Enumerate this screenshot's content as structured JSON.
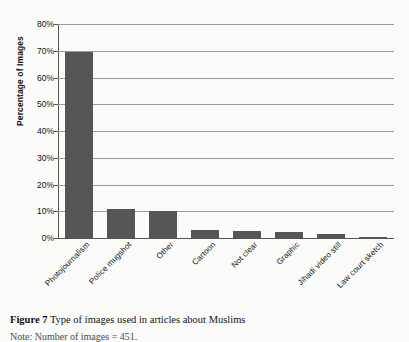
{
  "figure": {
    "caption_label": "Figure 7",
    "caption_text": "Type of images used in articles about Muslims",
    "note": "Note: Number of images = 451."
  },
  "chart_data": {
    "type": "bar",
    "title": "",
    "xlabel": "",
    "ylabel": "Percentage of Images",
    "ylim": [
      0,
      80
    ],
    "ytick_labels": [
      "0%",
      "10%",
      "20%",
      "30%",
      "40%",
      "50%",
      "60%",
      "70%",
      "80%"
    ],
    "ytick_values": [
      0,
      10,
      20,
      30,
      40,
      50,
      60,
      70,
      80
    ],
    "grid": true,
    "legend": "none",
    "bar_color": "#565656",
    "gridline_color": "#9a9a9a",
    "axis_color": "#555555",
    "categories": [
      "Photojournalism",
      "Police mugshot",
      "Other",
      "Cartoon",
      "Not clear",
      "Graphic",
      "Jihadi video still",
      "Law court sketch"
    ],
    "values": [
      69.5,
      11.0,
      10.0,
      3.0,
      2.5,
      2.3,
      1.5,
      0.5
    ]
  }
}
